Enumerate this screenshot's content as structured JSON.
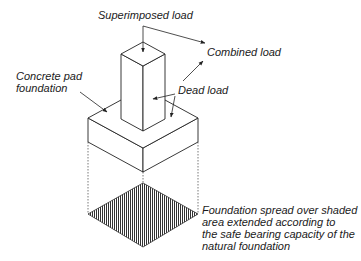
{
  "diagram": {
    "type": "isometric foundation diagram",
    "labels": {
      "superimposed_load": "Superimposed load",
      "combined_load": "Combined load",
      "concrete_pad": [
        "Concrete pad",
        "foundation"
      ],
      "dead_load": "Dead load",
      "foundation_spread": [
        "Foundation spread over shaded",
        "area extended according to",
        "the safe bearing capacity of the",
        "natural foundation"
      ]
    },
    "colors": {
      "line": "#222222",
      "hatch": "#333333",
      "background": "#ffffff"
    }
  }
}
